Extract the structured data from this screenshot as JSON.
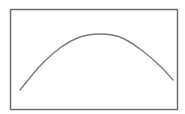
{
  "chart_data": {
    "type": "line",
    "title": "",
    "xlabel": "",
    "ylabel": "",
    "grid": false,
    "legend": null,
    "series": [
      {
        "name": "curve",
        "shape": "parabola (concave down)",
        "points_px": [
          [
            20,
            90
          ],
          [
            40,
            66
          ],
          [
            60,
            48
          ],
          [
            80,
            37
          ],
          [
            100,
            34
          ],
          [
            120,
            37
          ],
          [
            140,
            49
          ],
          [
            160,
            66
          ],
          [
            173,
            80
          ]
        ]
      }
    ],
    "frame_px": {
      "x": 10,
      "y": 9,
      "width": 167,
      "height": 100
    }
  },
  "colors": {
    "frame": "#6e6e6e",
    "curve": "#7a7a7a",
    "background": "#ffffff"
  }
}
